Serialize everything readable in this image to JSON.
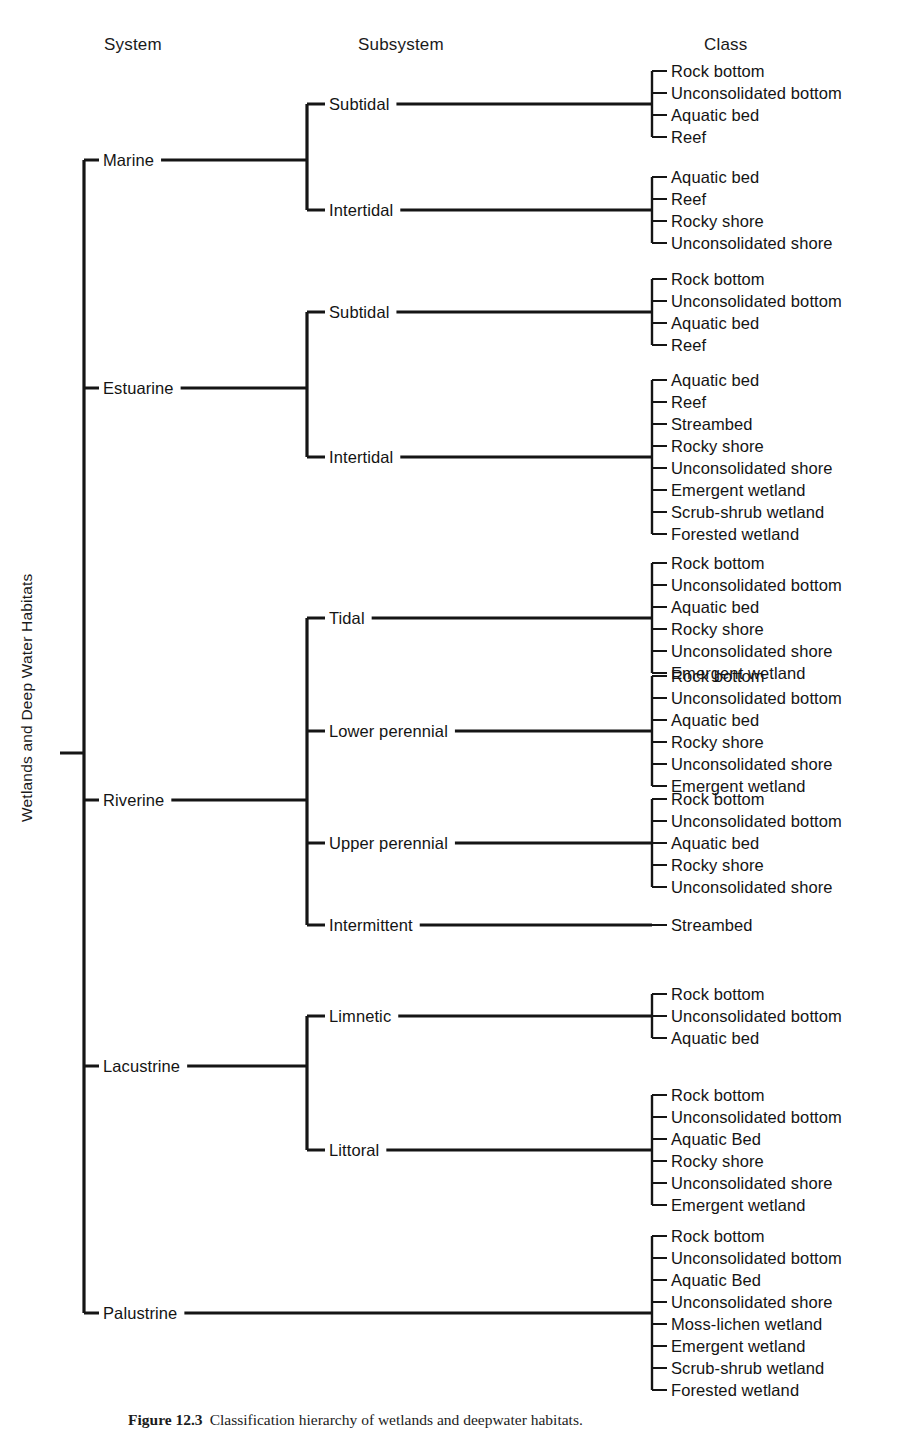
{
  "headers": {
    "system": "System",
    "subsystem": "Subsystem",
    "class": "Class"
  },
  "root": {
    "label": "Wetlands and Deep Water Habitats"
  },
  "caption": {
    "number": "Figure 12.3",
    "text": "Classification hierarchy of wetlands and deepwater habitats."
  },
  "systems": [
    {
      "label": "Marine",
      "subsystems": [
        {
          "label": "Subtidal",
          "classes": [
            "Rock bottom",
            "Unconsolidated bottom",
            "Aquatic bed",
            "Reef"
          ]
        },
        {
          "label": "Intertidal",
          "classes": [
            "Aquatic bed",
            "Reef",
            "Rocky shore",
            "Unconsolidated shore"
          ]
        }
      ]
    },
    {
      "label": "Estuarine",
      "subsystems": [
        {
          "label": "Subtidal",
          "classes": [
            "Rock bottom",
            "Unconsolidated bottom",
            "Aquatic bed",
            "Reef"
          ]
        },
        {
          "label": "Intertidal",
          "classes": [
            "Aquatic bed",
            "Reef",
            "Streambed",
            "Rocky shore",
            "Unconsolidated shore",
            "Emergent wetland",
            "Scrub-shrub wetland",
            "Forested wetland"
          ]
        }
      ]
    },
    {
      "label": "Riverine",
      "subsystems": [
        {
          "label": "Tidal",
          "classes": [
            "Rock bottom",
            "Unconsolidated bottom",
            "Aquatic bed",
            "Rocky shore",
            "Unconsolidated shore",
            "Emergent wetland"
          ]
        },
        {
          "label": "Lower perennial",
          "classes": [
            "Rock bottom",
            "Unconsolidated bottom",
            "Aquatic bed",
            "Rocky shore",
            "Unconsolidated shore",
            "Emergent wetland"
          ]
        },
        {
          "label": "Upper perennial",
          "classes": [
            "Rock bottom",
            "Unconsolidated bottom",
            "Aquatic bed",
            "Rocky shore",
            "Unconsolidated shore"
          ]
        },
        {
          "label": "Intermittent",
          "classes": [
            "Streambed"
          ]
        }
      ]
    },
    {
      "label": "Lacustrine",
      "subsystems": [
        {
          "label": "Limnetic",
          "classes": [
            "Rock bottom",
            "Unconsolidated bottom",
            "Aquatic bed"
          ]
        },
        {
          "label": "Littoral",
          "classes": [
            "Rock bottom",
            "Unconsolidated bottom",
            "Aquatic Bed",
            "Rocky shore",
            "Unconsolidated shore",
            "Emergent wetland"
          ]
        }
      ]
    },
    {
      "label": "Palustrine",
      "subsystems": [
        {
          "label": "",
          "classes": [
            "Rock bottom",
            "Unconsolidated bottom",
            "Aquatic Bed",
            "Unconsolidated shore",
            "Moss-lichen wetland",
            "Emergent wetland",
            "Scrub-shrub wetland",
            "Forested wetland"
          ]
        }
      ]
    }
  ],
  "geometry": {
    "root_spine_x": 84,
    "system_tick_x": 60,
    "system_label_x": 103,
    "subsystem_spine_x": 307,
    "subsystem_label_x": 329,
    "class_spine_x": 652,
    "class_text_x": 671,
    "class_line_height": 22,
    "system_y": [
      160,
      388,
      800,
      1066,
      1313
    ],
    "subsystem_y": [
      [
        104,
        210
      ],
      [
        312,
        457
      ],
      [
        618,
        731,
        843,
        925
      ],
      [
        1016,
        1150
      ],
      [
        1313
      ]
    ]
  },
  "colors": {
    "ink": "#151515",
    "background": "#ffffff"
  }
}
